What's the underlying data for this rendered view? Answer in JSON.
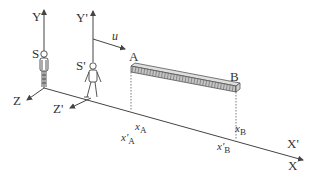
{
  "diagram": {
    "frames": {
      "S": {
        "label": "S",
        "axes": {
          "x": "X",
          "y": "Y",
          "z": "Z"
        }
      },
      "S_prime": {
        "label": "S'",
        "axes": {
          "x": "X'",
          "y": "Y'",
          "z": "Z'"
        }
      }
    },
    "velocity": {
      "label": "u"
    },
    "rod": {
      "end_a": "A",
      "end_b": "B"
    },
    "coordinates": {
      "xA": "x",
      "xA_sub": "A",
      "xpA": "x'",
      "xpA_sub": "A",
      "xB": "x",
      "xB_sub": "B",
      "xpB": "x'",
      "xpB_sub": "B"
    },
    "colors": {
      "line": "#444444",
      "rod_fill": "#bdbdbd",
      "rod_hatch": "#7a7a7a",
      "text": "#333333"
    }
  }
}
